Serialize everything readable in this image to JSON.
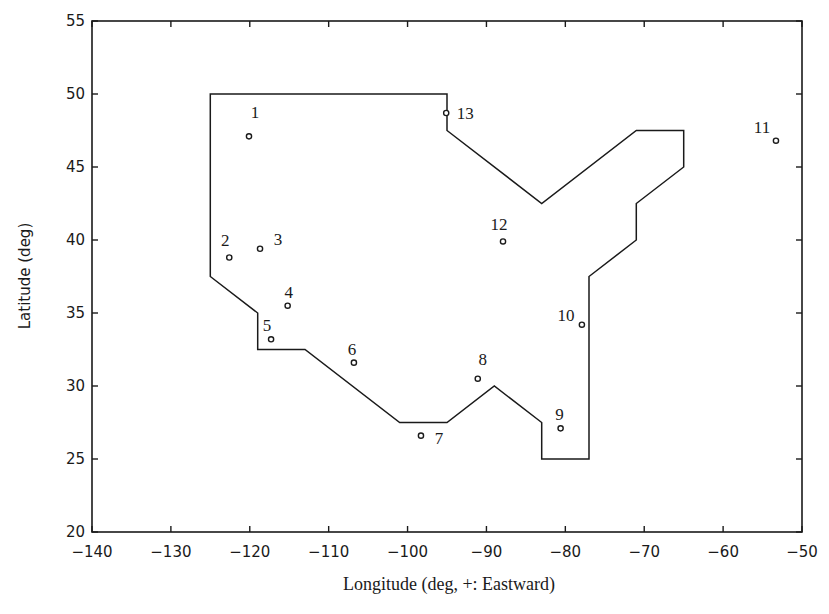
{
  "chart_data": {
    "type": "scatter",
    "title": "",
    "xlabel": "Longitude (deg, +: Eastward)",
    "ylabel": "Latitude (deg)",
    "xlim": [
      -140,
      -50
    ],
    "ylim": [
      20,
      55
    ],
    "xticks": [
      -140,
      -130,
      -120,
      -110,
      -100,
      -90,
      -80,
      -70,
      -60,
      -50
    ],
    "yticks": [
      20,
      25,
      30,
      35,
      40,
      45,
      50,
      55
    ],
    "grid": false,
    "legend": null,
    "boundary_polygon": [
      [
        -125,
        50
      ],
      [
        -95,
        50
      ],
      [
        -95,
        47.5
      ],
      [
        -83,
        42.5
      ],
      [
        -71,
        47.5
      ],
      [
        -65,
        47.5
      ],
      [
        -65,
        45
      ],
      [
        -71,
        42.5
      ],
      [
        -71,
        40
      ],
      [
        -77,
        37.5
      ],
      [
        -77,
        25
      ],
      [
        -83,
        25
      ],
      [
        -83,
        27.5
      ],
      [
        -89,
        30
      ],
      [
        -95,
        27.5
      ],
      [
        -101,
        27.5
      ],
      [
        -113,
        32.5
      ],
      [
        -119,
        32.5
      ],
      [
        -119,
        35
      ],
      [
        -125,
        37.5
      ]
    ],
    "points": [
      {
        "label": "1",
        "lon": -120.1,
        "lat": 47.1,
        "label_dx": 6,
        "label_dy": -18
      },
      {
        "label": "2",
        "lon": -122.6,
        "lat": 38.8,
        "label_dx": -4,
        "label_dy": -12
      },
      {
        "label": "3",
        "lon": -118.7,
        "lat": 39.4,
        "label_dx": 18,
        "label_dy": -4
      },
      {
        "label": "4",
        "lon": -115.2,
        "lat": 35.5,
        "label_dx": 1,
        "label_dy": -8
      },
      {
        "label": "5",
        "lon": -117.3,
        "lat": 33.2,
        "label_dx": -4,
        "label_dy": -8
      },
      {
        "label": "6",
        "lon": -106.8,
        "lat": 31.6,
        "label_dx": -2,
        "label_dy": -8
      },
      {
        "label": "7",
        "lon": -98.3,
        "lat": 26.6,
        "label_dx": 18,
        "label_dy": 8
      },
      {
        "label": "8",
        "lon": -91.1,
        "lat": 30.5,
        "label_dx": 5,
        "label_dy": -14
      },
      {
        "label": "9",
        "lon": -80.6,
        "lat": 27.1,
        "label_dx": -1,
        "label_dy": -8
      },
      {
        "label": "10",
        "lon": -77.9,
        "lat": 34.2,
        "label_dx": -16,
        "label_dy": -4
      },
      {
        "label": "11",
        "lon": -53.3,
        "lat": 46.8,
        "label_dx": -14,
        "label_dy": -8
      },
      {
        "label": "12",
        "lon": -87.9,
        "lat": 39.9,
        "label_dx": -4,
        "label_dy": -11
      },
      {
        "label": "13",
        "lon": -95.1,
        "lat": 48.7,
        "label_dx": 19,
        "label_dy": 6
      }
    ]
  },
  "axes": {
    "x_tick_labels": [
      "−140",
      "−130",
      "−120",
      "−110",
      "−100",
      "−90",
      "−80",
      "−70",
      "−60",
      "−50"
    ],
    "y_tick_labels": [
      "20",
      "25",
      "30",
      "35",
      "40",
      "45",
      "50",
      "55"
    ],
    "xlabel": "Longitude (deg, +: Eastward)",
    "ylabel": "Latitude (deg)"
  },
  "colors": {
    "line": "#1a1a1a",
    "background": "#ffffff"
  }
}
